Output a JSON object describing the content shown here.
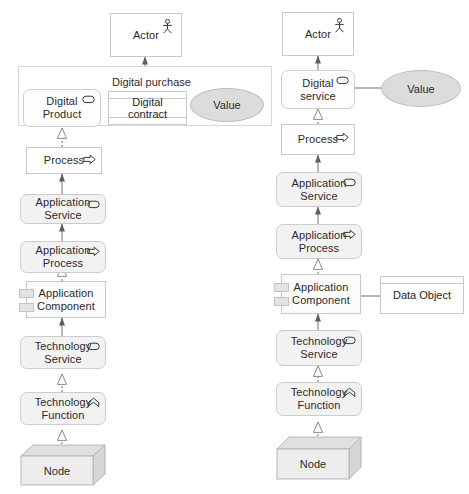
{
  "diagram": {
    "colors": {
      "stroke": "#c9c9c9",
      "text": "#2b2b2b",
      "grey_fill": "#f2f2f2",
      "white_fill": "#ffffff",
      "value_fill": "#dcdcdc",
      "node_fill": "#e8e8e8",
      "line": "#6f6f6f"
    }
  },
  "left_column": {
    "grouping_label": "Digital purchase",
    "nodes": {
      "actor": {
        "label": "Actor",
        "icon": "actor-stick-figure-icon"
      },
      "digital_product": {
        "label": "Digital\nProduct",
        "icon": "product-rounded-icon"
      },
      "digital_contract": {
        "label": "Digital contract",
        "icon": "contract-object-icon"
      },
      "value": {
        "label": "Value",
        "icon": "value-ellipse-icon"
      },
      "process": {
        "label": "Process",
        "icon": "process-arrow-icon"
      },
      "application_service": {
        "label": "Application\nService",
        "icon": "service-rounded-icon"
      },
      "application_process": {
        "label": "Application\nProcess",
        "icon": "process-arrow-icon"
      },
      "application_component": {
        "label": "Application\nComponent",
        "icon": "component-icon"
      },
      "technology_service": {
        "label": "Technology\nService",
        "icon": "service-rounded-icon"
      },
      "technology_function": {
        "label": "Technology\nFunction",
        "icon": "function-arrow-icon"
      },
      "node": {
        "label": "Node",
        "icon": "node-3d-box-icon"
      }
    }
  },
  "right_column": {
    "nodes": {
      "actor": {
        "label": "Actor",
        "icon": "actor-stick-figure-icon"
      },
      "digital_service": {
        "label": "Digital\nservice",
        "icon": "service-rounded-icon"
      },
      "value": {
        "label": "Value",
        "icon": "value-ellipse-icon"
      },
      "process": {
        "label": "Process",
        "icon": "process-arrow-icon"
      },
      "application_service": {
        "label": "Application\nService",
        "icon": "service-rounded-icon"
      },
      "application_process": {
        "label": "Application\nProcess",
        "icon": "process-arrow-icon"
      },
      "application_component": {
        "label": "Application\nComponent",
        "icon": "component-icon"
      },
      "data_object": {
        "label": "Data Object",
        "icon": "data-object-icon"
      },
      "technology_service": {
        "label": "Technology\nService",
        "icon": "service-rounded-icon"
      },
      "technology_function": {
        "label": "Technology\nFunction",
        "icon": "function-arrow-icon"
      },
      "node": {
        "label": "Node",
        "icon": "node-3d-box-icon"
      }
    }
  }
}
